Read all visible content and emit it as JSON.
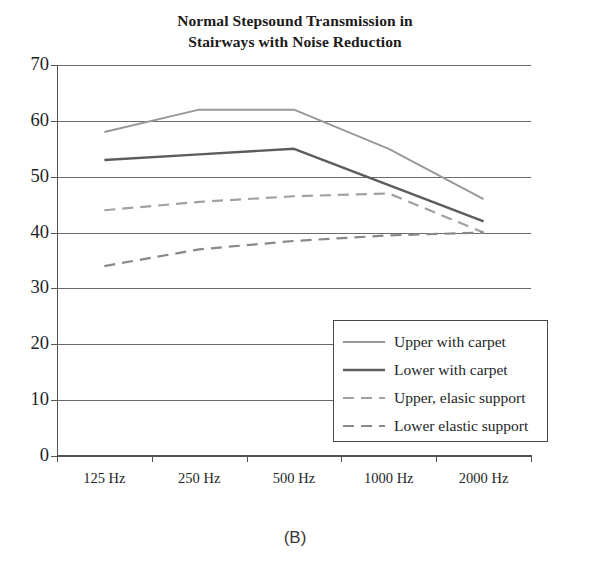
{
  "figure": {
    "title_line1": "Normal Stepsound Transmission in",
    "title_line2": "Stairways with Noise Reduction",
    "caption": "(B)"
  },
  "colors": {
    "upper_carpet": "#9a9896",
    "lower_carpet": "#5e5b59",
    "upper_elastic": "#a3a1a0",
    "lower_elastic": "#8b8886",
    "axis": "#55514f",
    "grid": "#6d6a68",
    "text": "#221f1f"
  },
  "chart_data": {
    "type": "line",
    "title": "Normal Stepsound Transmission in Stairways with Noise Reduction",
    "xlabel": "",
    "ylabel": "",
    "categories": [
      "125 Hz",
      "250 Hz",
      "500 Hz",
      "1000 Hz",
      "2000 Hz"
    ],
    "ylim": [
      0,
      70
    ],
    "yticks": [
      0,
      10,
      20,
      30,
      40,
      50,
      60,
      70
    ],
    "ytick_labels": [
      "0",
      "10",
      "20",
      "30",
      "40",
      "50",
      "60",
      "70"
    ],
    "grid": true,
    "legend_position": "lower right inside",
    "series": [
      {
        "name": "Upper with carpet",
        "style": "solid",
        "color": "#9a9896",
        "values": [
          58,
          62,
          62,
          55,
          46
        ]
      },
      {
        "name": "Lower with carpet",
        "style": "solid",
        "color": "#5e5b59",
        "values": [
          53,
          54,
          55,
          48.5,
          42
        ]
      },
      {
        "name": "Upper, elasic support",
        "style": "dashed",
        "color": "#a3a1a0",
        "values": [
          44,
          45.5,
          46.5,
          47,
          40
        ]
      },
      {
        "name": "Lower elastic support",
        "style": "dashed",
        "color": "#8b8886",
        "values": [
          34,
          37,
          38.5,
          39.5,
          40
        ]
      }
    ]
  }
}
